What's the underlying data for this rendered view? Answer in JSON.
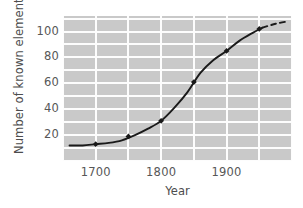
{
  "chart_data": {
    "type": "line",
    "title": "",
    "xlabel": "Year",
    "ylabel": "Number of known elements",
    "xlim": [
      1650,
      2000
    ],
    "ylim": [
      0,
      112
    ],
    "xticks": [
      1700,
      1800,
      1900
    ],
    "xtick_labels": [
      "1700",
      "1800",
      "1900"
    ],
    "yticks": [
      20,
      40,
      60,
      80,
      100
    ],
    "ytick_labels": [
      "20",
      "40",
      "60",
      "80",
      "100"
    ],
    "grid": true,
    "grid_x_step": 50,
    "grid_y_step": 10,
    "grid_color": "#fdfdfd",
    "plot_background": "#c9c9c9",
    "legend": null,
    "series": [
      {
        "name": "Known elements",
        "line_color": "#1a1a1a",
        "marker": "diamond",
        "x": [
          1700,
          1750,
          1800,
          1850,
          1900,
          1950
        ],
        "y": [
          13,
          19,
          31,
          61,
          85,
          102
        ],
        "curve_x": [
          1660,
          1680,
          1700,
          1720,
          1740,
          1760,
          1780,
          1800,
          1820,
          1840,
          1860,
          1880,
          1900,
          1920,
          1940,
          1955
        ],
        "curve_y": [
          12,
          12,
          13,
          14,
          16,
          20,
          25,
          31,
          41,
          53,
          68,
          78,
          85,
          93,
          99,
          103
        ]
      },
      {
        "name": "Extrapolation",
        "line_color": "#1a1a1a",
        "style": "dashed",
        "curve_x": [
          1955,
          1975,
          1995
        ],
        "curve_y": [
          103,
          106,
          108
        ]
      }
    ],
    "annotations": []
  },
  "axis": {
    "y_title": "Number of known elements",
    "x_title": "Year"
  }
}
